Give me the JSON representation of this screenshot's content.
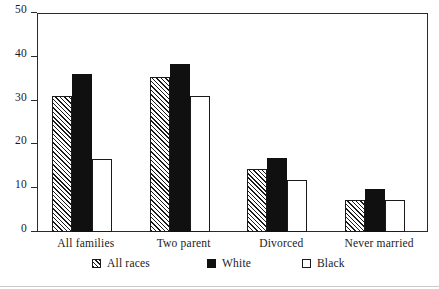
{
  "chart_data": {
    "type": "bar",
    "title": "",
    "subtitle": "",
    "xlabel": "",
    "ylabel": "",
    "ylim": [
      0,
      50
    ],
    "yticks": [
      0,
      10,
      20,
      30,
      40,
      50
    ],
    "ytick_labels": [
      "0",
      "10",
      "20",
      "30",
      "40",
      "50"
    ],
    "grid": false,
    "legend_position": "bottom-center",
    "categories": [
      "All families",
      "Two parent",
      "Divorced",
      "Never married"
    ],
    "series": [
      {
        "name": "All races",
        "fill": "hatch",
        "values": [
          31,
          35.5,
          14.5,
          7.3
        ]
      },
      {
        "name": "White",
        "fill": "solid",
        "values": [
          36,
          38.3,
          16.8,
          9.8
        ]
      },
      {
        "name": "Black",
        "fill": "open",
        "values": [
          16.6,
          31,
          11.9,
          7.2
        ]
      }
    ],
    "colors": {
      "axis": "#2b2b2b",
      "text": "#1a1a1a",
      "solid_fill": "#101010",
      "open_fill": "#ffffff",
      "hatch_line": "#1a1a1a",
      "background": "#ffffff"
    }
  }
}
